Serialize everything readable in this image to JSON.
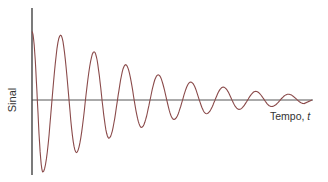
{
  "chart_data": {
    "type": "line",
    "title": "",
    "xlabel": "Tempo, t",
    "ylabel": "Sinal",
    "grid": false,
    "legend": null,
    "series": [
      {
        "name": "Sinal",
        "color": "#8a4a4a",
        "peaks": [
          {
            "t": 0.0,
            "y": 0.95,
            "kind": "start"
          },
          {
            "t": 0.11,
            "y": -1.0,
            "kind": "trough"
          },
          {
            "t": 0.29,
            "y": 0.9,
            "kind": "peak"
          },
          {
            "t": 0.45,
            "y": -0.73,
            "kind": "trough"
          },
          {
            "t": 0.63,
            "y": 0.67,
            "kind": "peak"
          },
          {
            "t": 0.78,
            "y": -0.53,
            "kind": "trough"
          },
          {
            "t": 0.95,
            "y": 0.49,
            "kind": "peak"
          },
          {
            "t": 1.11,
            "y": -0.38,
            "kind": "trough"
          },
          {
            "t": 1.28,
            "y": 0.35,
            "kind": "peak"
          },
          {
            "t": 1.44,
            "y": -0.27,
            "kind": "trough"
          },
          {
            "t": 1.61,
            "y": 0.25,
            "kind": "peak"
          },
          {
            "t": 1.77,
            "y": -0.19,
            "kind": "trough"
          },
          {
            "t": 1.94,
            "y": 0.18,
            "kind": "peak"
          },
          {
            "t": 2.1,
            "y": -0.13,
            "kind": "trough"
          },
          {
            "t": 2.27,
            "y": 0.12,
            "kind": "peak"
          },
          {
            "t": 2.43,
            "y": -0.09,
            "kind": "trough"
          },
          {
            "t": 2.6,
            "y": 0.08,
            "kind": "peak"
          },
          {
            "t": 2.76,
            "y": -0.05,
            "kind": "trough"
          }
        ]
      }
    ]
  },
  "labels": {
    "y_axis": "Sinal",
    "x_axis_text": "Tempo, ",
    "x_axis_var": "t"
  },
  "colors": {
    "axis": "#222222",
    "curve": "#8a4a4a"
  }
}
